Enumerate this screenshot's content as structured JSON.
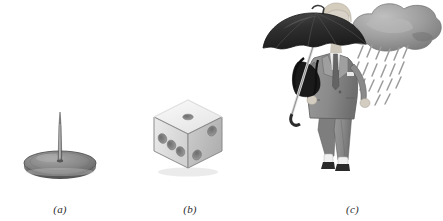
{
  "figure": {
    "background_color": "#ffffff",
    "width": 443,
    "height": 221,
    "style": "grayscale textbook line illustration"
  },
  "panels": [
    {
      "id": "a",
      "caption": "(a)",
      "subject": "thumbtack",
      "description": "A grey thumbtack (drawing pin) standing point-up on its round flat base, viewed at a slight angle so the circular base reads as an ellipse.",
      "colors": {
        "pin_shaft": "#6e6e6e",
        "pin_highlight": "#a8a8a8",
        "base_top": "#8a8a8a",
        "base_shadow": "#5f5f5f",
        "outline": "#4a4a4a"
      },
      "geometry": {
        "base_center_x": 60,
        "base_center_y": 163,
        "base_radius_x": 36,
        "base_radius_y": 12,
        "pin_tip_y": 112,
        "pin_height": 52
      }
    },
    {
      "id": "b",
      "caption": "(b)",
      "subject": "die",
      "description": "A single white six-sided die drawn in isometric projection with rounded corners, showing three faces.",
      "faces": [
        {
          "name": "top",
          "pips": 1
        },
        {
          "name": "left",
          "pips": 3
        },
        {
          "name": "right",
          "pips": 2
        }
      ],
      "pip_total_visible": 6,
      "colors": {
        "top_face": "#f2f2f2",
        "left_face": "#e3e3e3",
        "right_face": "#c9c9c9",
        "pip_fill": "#8d8d8d",
        "pip_shadow": "#5c5c5c",
        "outline": "#6a6a6a"
      }
    },
    {
      "id": "c",
      "caption": "(c)",
      "subject": "woman-with-umbrella-in-rain",
      "description": "A woman in a grey business suit wearing dark sunglasses walks to the right holding a large black open umbrella over her shoulder; a dark grey rain cloud above her right drops diagonal streaks of rain.",
      "elements": [
        {
          "name": "rain-cloud",
          "label": "rain cloud"
        },
        {
          "name": "rain-streaks",
          "label": "falling rain"
        },
        {
          "name": "umbrella",
          "label": "open black umbrella"
        },
        {
          "name": "umbrella-handle",
          "label": "umbrella shaft and handle"
        },
        {
          "name": "woman-head",
          "label": "head with blonde hair"
        },
        {
          "name": "sunglasses",
          "label": "dark sunglasses"
        },
        {
          "name": "suit-jacket",
          "label": "grey suit jacket"
        },
        {
          "name": "necktie",
          "label": "necktie"
        },
        {
          "name": "shoulder-bag",
          "label": "black shoulder bag"
        },
        {
          "name": "trousers",
          "label": "grey suit trousers"
        },
        {
          "name": "shoes",
          "label": "dark shoes with white socks"
        }
      ],
      "colors": {
        "cloud_light": "#b6b6b6",
        "cloud_mid": "#9a9a9a",
        "cloud_dark": "#7d7d7d",
        "rain": "#9b9b9b",
        "umbrella": "#2e2e2e",
        "umbrella_mid": "#3c3c3c",
        "suit": "#8f8f8f",
        "suit_dark": "#6d6d6d",
        "skin": "#d8d2c8",
        "hair": "#d4cdbe",
        "sunglasses": "#1f1f1f",
        "bag": "#1a1a1a",
        "shirt": "#ededed",
        "sock": "#f0f0f0",
        "shoe": "#2a2a2a"
      }
    }
  ]
}
